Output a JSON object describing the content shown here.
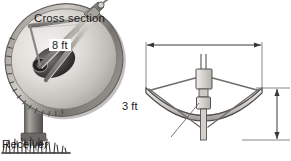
{
  "figure": {
    "background_color": "#ffffff",
    "ink_color": "#1a1a1a"
  },
  "dish_illustration": {
    "name": "satellite-dish-photo",
    "description": "Grayscale drawing of a parabolic satellite dish on a pedestal with grass at its base",
    "parts": [
      "dish-reflector",
      "dish-rim",
      "feed-support-struts",
      "feed-horn",
      "pedestal-mast",
      "ground-grass"
    ],
    "colors": {
      "dish_light": "#e8e6e2",
      "dish_mid": "#b9b6b1",
      "dish_dark": "#6f6d6b",
      "rim": "#8d8a86",
      "mast": "#7d7a77",
      "grass": "#4a4846"
    }
  },
  "cross_section": {
    "title": "Cross section",
    "width_dimension": {
      "label": "8 ft",
      "value": 8,
      "unit": "ft",
      "orientation": "horizontal"
    },
    "depth_dimension": {
      "label": "3 ft",
      "value": 3,
      "unit": "ft",
      "orientation": "vertical"
    },
    "receiver": {
      "label": "Receiver",
      "position": "focus of the parabola"
    },
    "colors": {
      "outline": "#4d4b49",
      "fill": "#d7d5d1",
      "strut": "#6a6866",
      "leader": "#6a6866"
    }
  }
}
